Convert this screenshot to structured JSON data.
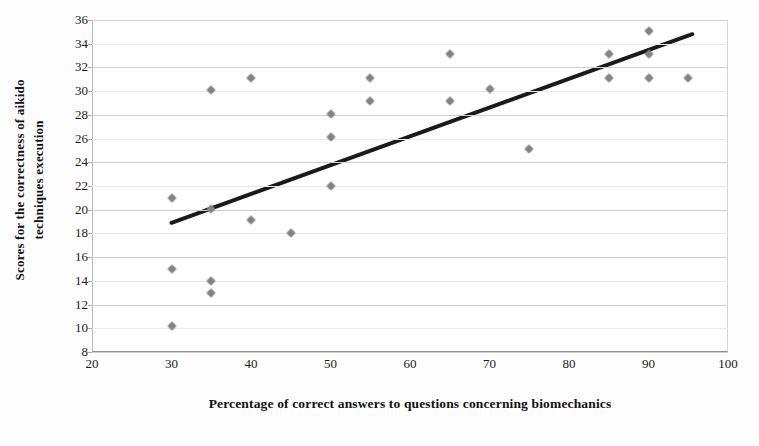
{
  "chart_data": {
    "type": "scatter",
    "title": "",
    "xlabel": "Percentage of correct answers to questions concerning biomechanics",
    "ylabel_line1": "Scores for the correctness of aikido",
    "ylabel_line2": "techniques execution",
    "xlim": [
      20,
      100
    ],
    "ylim": [
      8,
      36
    ],
    "xticks": [
      20,
      30,
      40,
      50,
      60,
      70,
      80,
      90,
      100
    ],
    "yticks": [
      8,
      10,
      12,
      14,
      16,
      18,
      20,
      22,
      24,
      26,
      28,
      30,
      32,
      34,
      36
    ],
    "grid": "horizontal",
    "legend": "none",
    "marker_color": "#8a8a8a",
    "trendline_color": "#1a1a1a",
    "points": [
      {
        "x": 30,
        "y": 21.0
      },
      {
        "x": 30,
        "y": 15.0
      },
      {
        "x": 30,
        "y": 10.2
      },
      {
        "x": 35,
        "y": 30.1
      },
      {
        "x": 35,
        "y": 20.1
      },
      {
        "x": 35,
        "y": 14.0
      },
      {
        "x": 35,
        "y": 13.0
      },
      {
        "x": 40,
        "y": 31.1
      },
      {
        "x": 40,
        "y": 19.1
      },
      {
        "x": 45,
        "y": 18.0
      },
      {
        "x": 50,
        "y": 28.1
      },
      {
        "x": 50,
        "y": 26.1
      },
      {
        "x": 50,
        "y": 22.0
      },
      {
        "x": 55,
        "y": 31.1
      },
      {
        "x": 55,
        "y": 29.2
      },
      {
        "x": 65,
        "y": 33.1
      },
      {
        "x": 65,
        "y": 29.2
      },
      {
        "x": 70,
        "y": 30.2
      },
      {
        "x": 75,
        "y": 25.1
      },
      {
        "x": 85,
        "y": 33.1
      },
      {
        "x": 85,
        "y": 31.1
      },
      {
        "x": 90,
        "y": 35.1
      },
      {
        "x": 90,
        "y": 33.1
      },
      {
        "x": 90,
        "y": 31.1
      },
      {
        "x": 95,
        "y": 31.1
      }
    ],
    "trendline": {
      "x0": 30,
      "y0": 18.9,
      "x1": 95.5,
      "y1": 34.8
    }
  }
}
